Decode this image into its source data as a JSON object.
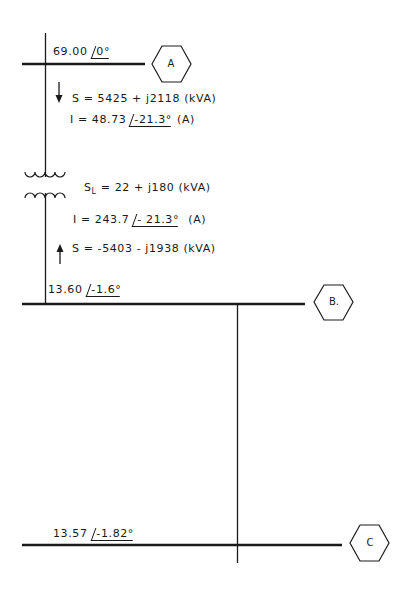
{
  "diagram": {
    "type": "one-line power system diagram",
    "colors": {
      "line": "#1a1a1a",
      "background": "#ffffff"
    },
    "buses": [
      {
        "id": "A",
        "label": "A",
        "voltage": "69.00",
        "angle": "0°"
      },
      {
        "id": "B",
        "label": "B.",
        "voltage": "13.60",
        "angle": "-1.6°"
      },
      {
        "id": "C",
        "label": "C",
        "voltage": "13.57",
        "angle": "-1.82°"
      }
    ],
    "branch_AB": {
      "sending": {
        "arrow": "down-arrow",
        "power": "S = 5425 + j2118 (kVA)",
        "current_prefix": "I = 48.73",
        "current_angle": "-21.3°",
        "current_unit": "(A)"
      },
      "transformer": {
        "loss_symbol": "S",
        "loss_subscript": "L",
        "loss_value": "= 22 + j180 (kVA)"
      },
      "receiving": {
        "current_prefix": "I = 243.7",
        "current_angle": "- 21.3°",
        "current_unit": "(A)",
        "arrow": "up-arrow",
        "power": "S = -5403 - j1938 (kVA)"
      }
    }
  }
}
